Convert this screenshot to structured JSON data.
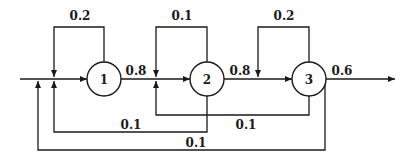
{
  "diagram": {
    "type": "flow-network",
    "nodes": [
      {
        "id": "1",
        "label": "1"
      },
      {
        "id": "2",
        "label": "2"
      },
      {
        "id": "3",
        "label": "3"
      }
    ],
    "edges": [
      {
        "from": "1",
        "to": "1",
        "label": "0.2",
        "kind": "self-loop"
      },
      {
        "from": "2",
        "to": "2",
        "label": "0.1",
        "kind": "self-loop"
      },
      {
        "from": "3",
        "to": "3",
        "label": "0.2",
        "kind": "self-loop"
      },
      {
        "from": "1",
        "to": "2",
        "label": "0.8",
        "kind": "forward"
      },
      {
        "from": "2",
        "to": "3",
        "label": "0.8",
        "kind": "forward"
      },
      {
        "from": "3",
        "to": "exit",
        "label": "0.6",
        "kind": "output"
      },
      {
        "from": "2",
        "to": "1",
        "label": "0.1",
        "kind": "feedback"
      },
      {
        "from": "3",
        "to": "2",
        "label": "0.1",
        "kind": "feedback"
      },
      {
        "from": "3",
        "to": "1",
        "label": "0.1",
        "kind": "feedback-outer"
      }
    ],
    "labels": {
      "node1": "1",
      "node2": "2",
      "node3": "3",
      "self1": "0.2",
      "self2": "0.1",
      "self3": "0.2",
      "fwd12": "0.8",
      "fwd23": "0.8",
      "out3": "0.6",
      "fb21": "0.1",
      "fb32": "0.1",
      "fb31": "0.1"
    },
    "colors": {
      "stroke": "#1a1a1a",
      "background": "#ffffff"
    }
  }
}
